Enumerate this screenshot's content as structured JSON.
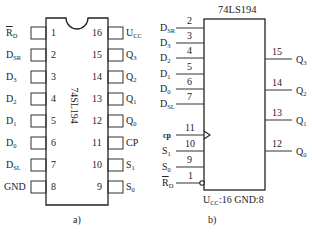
{
  "figure_a": {
    "caption": "a)",
    "chip_label": "74SL194",
    "left_pins": [
      {
        "num": "1",
        "name": "R",
        "sub": "D",
        "overline": true
      },
      {
        "num": "2",
        "name": "D",
        "sub": "SR"
      },
      {
        "num": "3",
        "name": "D",
        "sub": "3"
      },
      {
        "num": "4",
        "name": "D",
        "sub": "2"
      },
      {
        "num": "5",
        "name": "D",
        "sub": "1"
      },
      {
        "num": "6",
        "name": "D",
        "sub": "0"
      },
      {
        "num": "7",
        "name": "D",
        "sub": "SL"
      },
      {
        "num": "8",
        "name": "GND",
        "sub": ""
      }
    ],
    "right_pins": [
      {
        "num": "16",
        "name": "U",
        "sub": "CC"
      },
      {
        "num": "15",
        "name": "Q",
        "sub": "3"
      },
      {
        "num": "14",
        "name": "Q",
        "sub": "2"
      },
      {
        "num": "13",
        "name": "Q",
        "sub": "1"
      },
      {
        "num": "12",
        "name": "Q",
        "sub": "0"
      },
      {
        "num": "11",
        "name": "CP",
        "sub": ""
      },
      {
        "num": "10",
        "name": "S",
        "sub": "1"
      },
      {
        "num": "9",
        "name": "S",
        "sub": "0"
      }
    ]
  },
  "figure_b": {
    "caption": "b)",
    "title": "74LS194",
    "power_note_u": "U",
    "power_note_sub": "CC",
    "power_note_rest": ":16  GND:8",
    "left_pins": [
      {
        "num": "2",
        "name": "D",
        "sub": "SR"
      },
      {
        "num": "3",
        "name": "D",
        "sub": "3"
      },
      {
        "num": "4",
        "name": "D",
        "sub": "2"
      },
      {
        "num": "5",
        "name": "D",
        "sub": "1"
      },
      {
        "num": "6",
        "name": "D",
        "sub": "0"
      },
      {
        "num": "7",
        "name": "D",
        "sub": "SL"
      },
      {
        "num": "11",
        "name": "cp",
        "sub": ""
      },
      {
        "num": "10",
        "name": "S",
        "sub": "1"
      },
      {
        "num": "9",
        "name": "S",
        "sub": "0"
      },
      {
        "num": "1",
        "name": "R",
        "sub": "D",
        "overline": true
      }
    ],
    "right_pins": [
      {
        "num": "15",
        "name": "Q",
        "sub": "3"
      },
      {
        "num": "14",
        "name": "Q",
        "sub": "2"
      },
      {
        "num": "13",
        "name": "Q",
        "sub": "1"
      },
      {
        "num": "12",
        "name": "Q",
        "sub": "0"
      }
    ]
  }
}
